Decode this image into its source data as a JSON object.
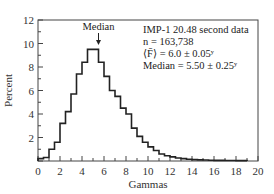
{
  "chart_data": {
    "type": "bar",
    "title": "",
    "xlabel": "Gammas",
    "ylabel": "Percent",
    "xlim": [
      0,
      20
    ],
    "ylim": [
      0,
      12
    ],
    "xticks": [
      0,
      2,
      4,
      6,
      8,
      10,
      12,
      14,
      16,
      18,
      20
    ],
    "yticks": [
      2,
      4,
      6,
      8,
      10,
      12
    ],
    "bin_width": 0.5,
    "bins_start": [
      0,
      0.5,
      1,
      1.5,
      2,
      2.5,
      3,
      3.5,
      4,
      4.5,
      5,
      5.5,
      6,
      6.5,
      7,
      7.5,
      8,
      8.5,
      9,
      9.5,
      10,
      10.5,
      11,
      11.5,
      12,
      12.5,
      13,
      13.5,
      14,
      14.5,
      15,
      15.5,
      16,
      16.5,
      17,
      17.5,
      18,
      18.5
    ],
    "values": [
      0.2,
      0.3,
      1.0,
      1.6,
      3.2,
      4.2,
      5.7,
      7.4,
      8.4,
      9.5,
      9.5,
      8.4,
      7.2,
      6.0,
      5.5,
      4.5,
      4.0,
      2.8,
      2.1,
      1.6,
      1.2,
      0.9,
      0.6,
      0.45,
      0.35,
      0.25,
      0.2,
      0.15,
      0.12,
      0.1,
      0.08,
      0.06,
      0.05,
      0.05,
      0.04,
      0.04,
      0.03,
      0.03
    ],
    "annotations": [
      {
        "text": "Median",
        "x": 5.5,
        "arrow": true
      },
      {
        "text": "IMP-1 20.48 second data"
      },
      {
        "text": "n = 163,738"
      },
      {
        "text": "⟨F̄⟩ = 6.0 ± 0.05γ"
      },
      {
        "text": "Median = 5.50 ± 0.25γ"
      }
    ],
    "grid": false
  },
  "labels": {
    "xlabel": "Gammas",
    "ylabel": "Percent",
    "median": "Median",
    "info1": "IMP-1 20.48 second data",
    "info2": "n = 163,738",
    "info3": "⟨F̄⟩ = 6.0 ± 0.05ʸ",
    "info4": "Median = 5.50 ± 0.25ʸ"
  }
}
